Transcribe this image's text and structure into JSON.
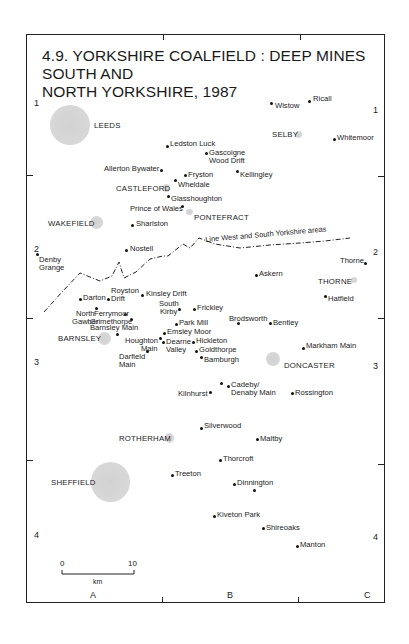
{
  "title_line1": "4.9. YORKSHIRE COALFIELD : DEEP MINES SOUTH AND",
  "title_line2": "NORTH YORKSHIRE, 1987",
  "grid": {
    "rows_left": [
      "1",
      "2",
      "3",
      "4"
    ],
    "rows_right": [
      "1",
      "2",
      "3",
      "4"
    ],
    "cols": [
      "A",
      "B",
      "C"
    ]
  },
  "boundary_label": "Line West and South Yorkshire areas",
  "towns": {
    "leeds": "LEEDS",
    "selby": "SELBY",
    "castleford": "CASTLEFORD",
    "pontefract": "PONTEFRACT",
    "wakefield": "WAKEFIELD",
    "thorne": "THORNE",
    "barnsley": "BARNSLEY",
    "doncaster": "DONCASTER",
    "rotherham": "ROTHERHAM",
    "sheffield": "SHEFFIELD"
  },
  "mines": {
    "wistow": "Wistow",
    "ricall": "Ricall",
    "whitemoor": "Whitemoor",
    "ledston_luck": "Ledston Luck",
    "gascoigne_1": "Gascoigne",
    "gascoigne_2": "Wood Drift",
    "allerton_bywater": "Allerton Bywater",
    "fryston": "Fryston",
    "kellingley": "Kellingley",
    "wheldale": "Wheldale",
    "glasshoughton": "Glasshoughton",
    "prince_of_wales": "Prince of Wales",
    "sharlston": "Sharlston",
    "nostell": "Nostell",
    "denby_1": "Denby",
    "denby_2": "Grange",
    "thorne_mine": "Thorne",
    "asken": "Askern",
    "hatfield": "Hatfield",
    "darton": "Darton",
    "royston_1": "Royston",
    "royston_2": "Drift",
    "kinsley": "Kinsley Drift",
    "north_gawber_1": "North",
    "north_gawber_2": "Gawber",
    "ferrymoor_1": "Ferrymoor",
    "ferrymoor_2": "Grimethorpe",
    "south_kirby_1": "South",
    "south_kirby_2": "Kirby",
    "frickley": "Frickley",
    "park_mill": "Park Mill",
    "barnsley_main": "Barnsley Main",
    "emsley_moor": "Emsley Moor",
    "houghton_1": "Houghton",
    "houghton_2": "Main",
    "dearne_1": "Dearne",
    "dearne_2": "Valley",
    "hickleton": "Hickleton",
    "goldthorpe": "Goldthorpe",
    "darfield_1": "Darfield",
    "darfield_2": "Main",
    "bamburgh": "Bamburgh",
    "brodsworth": "Brodsworth",
    "bentley": "Bentley",
    "markham_main": "Markham Main",
    "kilnhurst": "Kilnhurst",
    "cadeby_1": "Cadeby/",
    "cadeby_2": "Denaby Main",
    "rossington": "Rossington",
    "silverwood": "Silverwood",
    "maltby": "Maltby",
    "thorcroft": "Thorcroft",
    "treeton": "Treeton",
    "dinnington": "Dinnington",
    "kiveton_park": "Kiveton Park",
    "shireoaks": "Shireoaks",
    "manton": "Manton"
  },
  "scale": {
    "start": "0",
    "end": "10",
    "unit": "km"
  }
}
